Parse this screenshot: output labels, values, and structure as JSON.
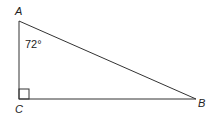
{
  "diagram": {
    "type": "right-triangle",
    "vertices": {
      "A": {
        "label": "A",
        "x": 19,
        "y": 21
      },
      "B": {
        "label": "B",
        "x": 196,
        "y": 99
      },
      "C": {
        "label": "C",
        "x": 19,
        "y": 99
      }
    },
    "angle_A": {
      "label": "72°",
      "value_deg": 72
    },
    "right_angle_at": "C",
    "stroke_color": "#333333",
    "background": "#ffffff"
  }
}
